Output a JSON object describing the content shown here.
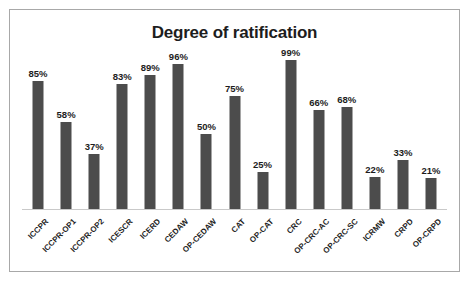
{
  "chart_data": {
    "type": "bar",
    "title": "Degree of ratification",
    "xlabel": "",
    "ylabel": "",
    "ylim": [
      0,
      100
    ],
    "grid": false,
    "legend": "none",
    "value_suffix": "%",
    "categories": [
      "ICCPR",
      "ICCPR-OP1",
      "ICCPR-OP2",
      "ICESCR",
      "ICERD",
      "CEDAW",
      "OP-CEDAW",
      "CAT",
      "OP-CAT",
      "CRC",
      "OP-CRC-AC",
      "OP-CRC-SC",
      "ICRMW",
      "CRPD",
      "OP-CRPD"
    ],
    "values": [
      85,
      58,
      37,
      83,
      89,
      96,
      50,
      75,
      25,
      99,
      66,
      68,
      22,
      33,
      21
    ],
    "value_labels": [
      "85%",
      "58%",
      "37%",
      "83%",
      "89%",
      "96%",
      "50%",
      "75%",
      "25%",
      "99%",
      "66%",
      "68%",
      "22%",
      "33%",
      "21%"
    ],
    "bar_color": "#4c4c4c",
    "title_color": "#1d1d1d",
    "baseline_color": "#c9c9c9",
    "border_color": "#a8a8a8",
    "background_color": "#ffffff"
  }
}
